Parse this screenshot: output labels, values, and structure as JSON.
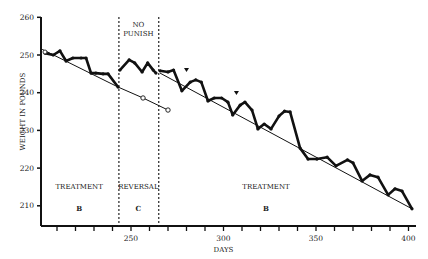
{
  "chart_data": {
    "type": "line",
    "title": "",
    "xlabel": "DAYS",
    "ylabel": "WEIGHT IN POUNDS",
    "xlim": [
      200,
      405
    ],
    "ylim": [
      205,
      260
    ],
    "x_ticks": [
      250,
      300,
      350,
      400
    ],
    "y_ticks": [
      210,
      220,
      230,
      240,
      250,
      260
    ],
    "grid": false,
    "phase_boundaries": [
      244,
      265
    ],
    "phases": [
      {
        "label": "TREATMENT",
        "code": "B",
        "x_center": 222
      },
      {
        "label": "REVERSAL",
        "code": "C",
        "x_center": 254,
        "note": "NO PUNISH"
      },
      {
        "label": "TREATMENT",
        "code": "B",
        "x_center": 323
      }
    ],
    "series": [
      {
        "name": "Weight (Treatment B, first)",
        "style": "thick",
        "points": [
          [
            203.5,
            250.5
          ],
          [
            208,
            250
          ],
          [
            211.6,
            251.1
          ],
          [
            214.9,
            248.4
          ],
          [
            218.6,
            249.2
          ],
          [
            223,
            249.2
          ],
          [
            225.7,
            249.2
          ],
          [
            228.4,
            245.2
          ],
          [
            231,
            245.2
          ],
          [
            234.9,
            245
          ],
          [
            237.6,
            245
          ],
          [
            243,
            241.5
          ]
        ]
      },
      {
        "name": "Weight (Reversal C)",
        "style": "thick",
        "points": [
          [
            244,
            246
          ],
          [
            249,
            248.7
          ],
          [
            252,
            247.9
          ],
          [
            256,
            245.5
          ],
          [
            259,
            247.9
          ],
          [
            262,
            246
          ],
          [
            263.5,
            245.2
          ]
        ]
      },
      {
        "name": "Weight (Treatment B, second)",
        "style": "thick",
        "points": [
          [
            265.7,
            245.8
          ],
          [
            270,
            245.5
          ],
          [
            273,
            246
          ],
          [
            277.5,
            240.5
          ],
          [
            282,
            242.8
          ],
          [
            285,
            243.4
          ],
          [
            288,
            242.8
          ],
          [
            291.6,
            237.8
          ],
          [
            295,
            238.6
          ],
          [
            299,
            238.6
          ],
          [
            302.4,
            237.5
          ],
          [
            305,
            234.1
          ],
          [
            309,
            236.7
          ],
          [
            311.6,
            237.5
          ],
          [
            315.4,
            235.4
          ],
          [
            318.6,
            230.4
          ],
          [
            322,
            231.7
          ],
          [
            325.7,
            230.4
          ],
          [
            330,
            233.8
          ],
          [
            333,
            235.1
          ],
          [
            336,
            234.9
          ],
          [
            341.4,
            225.3
          ],
          [
            345.7,
            222.4
          ],
          [
            350.5,
            222.4
          ],
          [
            356,
            222.9
          ],
          [
            360.8,
            220.6
          ],
          [
            367,
            222.2
          ],
          [
            370,
            221.4
          ],
          [
            374.9,
            216.6
          ],
          [
            379.2,
            218.2
          ],
          [
            383.5,
            217.6
          ],
          [
            389,
            212.9
          ],
          [
            392.7,
            214.5
          ],
          [
            396.5,
            213.9
          ],
          [
            401.9,
            209.2
          ]
        ]
      },
      {
        "name": "Trend (first treatment)",
        "style": "thin",
        "points": [
          [
            202,
            251.5
          ],
          [
            243,
            241.5
          ]
        ]
      },
      {
        "name": "Projected trend (open circles)",
        "style": "thin-circles",
        "points": [
          [
            243,
            241.5
          ],
          [
            256.5,
            238.6
          ],
          [
            270,
            235.4
          ]
        ]
      },
      {
        "name": "Trend (second treatment)",
        "style": "thin",
        "points": [
          [
            265.7,
            245.2
          ],
          [
            401.9,
            209.2
          ]
        ]
      }
    ],
    "markers": [
      {
        "type": "triangle-down",
        "x": 280,
        "y": 246
      },
      {
        "type": "triangle-down",
        "x": 307,
        "y": 239.9
      }
    ]
  }
}
